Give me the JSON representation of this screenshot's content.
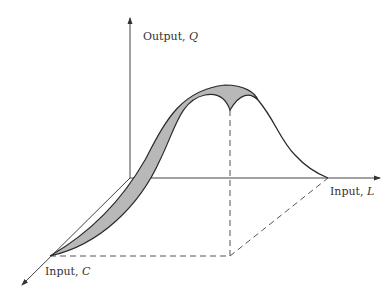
{
  "diagram": {
    "type": "3d-production-surface-slice",
    "axes": {
      "output": {
        "name": "Output",
        "symbol": "Q"
      },
      "labor": {
        "name": "Input",
        "symbol": "L"
      },
      "capital": {
        "name": "Input",
        "symbol": "C"
      }
    },
    "colors": {
      "fill": "#b8b8b8",
      "line": "#2a2a2a",
      "axis": "#444444",
      "dashed": "#555555"
    }
  }
}
